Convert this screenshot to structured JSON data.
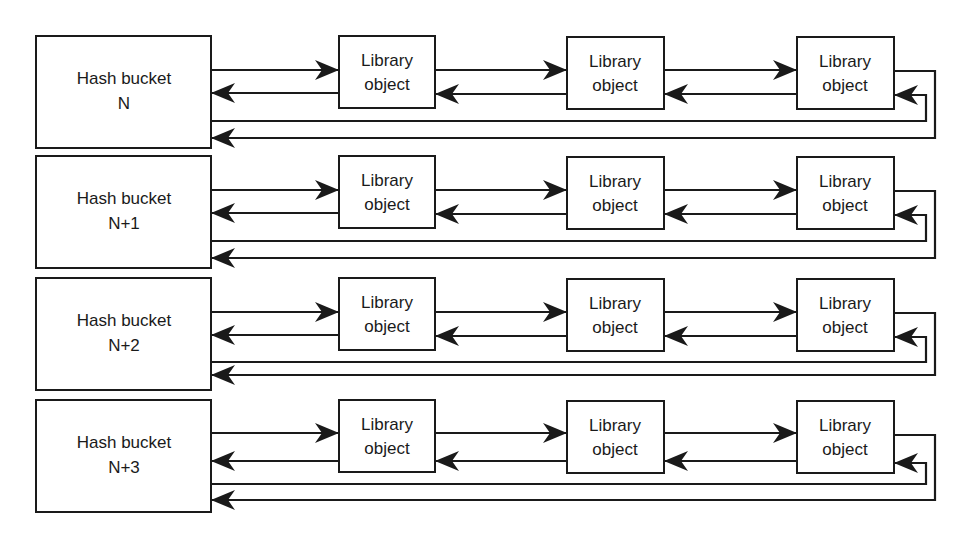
{
  "diagram": {
    "type": "hash-chain-linked-list",
    "rows": [
      {
        "bucket": {
          "line1": "Hash bucket",
          "line2": "N"
        },
        "objects": [
          {
            "line1": "Library",
            "line2": "object"
          },
          {
            "line1": "Library",
            "line2": "object"
          },
          {
            "line1": "Library",
            "line2": "object"
          }
        ]
      },
      {
        "bucket": {
          "line1": "Hash bucket",
          "line2": "N+1"
        },
        "objects": [
          {
            "line1": "Library",
            "line2": "object"
          },
          {
            "line1": "Library",
            "line2": "object"
          },
          {
            "line1": "Library",
            "line2": "object"
          }
        ]
      },
      {
        "bucket": {
          "line1": "Hash bucket",
          "line2": "N+2"
        },
        "objects": [
          {
            "line1": "Library",
            "line2": "object"
          },
          {
            "line1": "Library",
            "line2": "object"
          },
          {
            "line1": "Library",
            "line2": "object"
          }
        ]
      },
      {
        "bucket": {
          "line1": "Hash bucket",
          "line2": "N+3"
        },
        "objects": [
          {
            "line1": "Library",
            "line2": "object"
          },
          {
            "line1": "Library",
            "line2": "object"
          },
          {
            "line1": "Library",
            "line2": "object"
          }
        ]
      }
    ],
    "edges": [
      {
        "from": "bucket",
        "to": "object-1",
        "direction": "forward"
      },
      {
        "from": "object-1",
        "to": "bucket",
        "direction": "backward"
      },
      {
        "from": "object-1",
        "to": "object-2",
        "direction": "forward"
      },
      {
        "from": "object-2",
        "to": "object-1",
        "direction": "backward"
      },
      {
        "from": "object-2",
        "to": "object-3",
        "direction": "forward"
      },
      {
        "from": "object-3",
        "to": "object-2",
        "direction": "backward"
      },
      {
        "from": "bucket",
        "to": "object-3",
        "direction": "wrap-backward"
      },
      {
        "from": "object-3",
        "to": "bucket",
        "direction": "wrap-forward"
      }
    ],
    "colors": {
      "stroke": "#1a1a1a",
      "fill": "#ffffff",
      "background": "#ffffff"
    }
  }
}
